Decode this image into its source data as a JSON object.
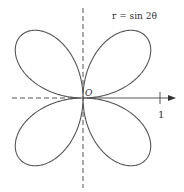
{
  "figure": {
    "equation_label": "r = sin 2θ",
    "origin_label": "O",
    "tick_label": "1",
    "curve": {
      "type": "four-leaved rose",
      "equation": "r = sin 2θ",
      "color": "#555555"
    },
    "axes": {
      "color": "#444444",
      "polar_axis": "horizontal arrow to the right",
      "dashed_lines": [
        "negative x-axis",
        "vertical axis"
      ]
    }
  }
}
